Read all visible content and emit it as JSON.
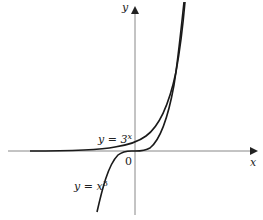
{
  "diagram": {
    "axes": {
      "x_label": "x",
      "y_label": "y",
      "origin_label": "0"
    },
    "curves": [
      {
        "name": "exponential",
        "label": "y = 3",
        "exponent": "x"
      },
      {
        "name": "cubic",
        "label": "y = x",
        "exponent": "3"
      }
    ],
    "colors": {
      "curve": "#1a1a1a",
      "axis": "#888888"
    }
  }
}
